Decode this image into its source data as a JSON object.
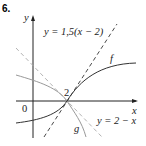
{
  "exercise": {
    "number": "6."
  },
  "axes": {
    "x_label": "x",
    "y_label": "y",
    "origin_label": "0"
  },
  "annotations": {
    "tangent_label": "y = 1,5(x − 2)",
    "line_label": "y = 2 − x",
    "f_label": "f",
    "g_label": "g",
    "point_label": "2"
  },
  "colors": {
    "axes": "#222222",
    "curve_f": "#333333",
    "curve_g": "#999999",
    "dashed": "#333333",
    "dashed_light": "#aaaaaa"
  }
}
